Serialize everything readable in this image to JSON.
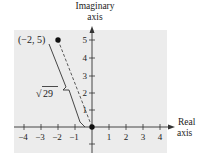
{
  "diagram": {
    "type": "complex-plane",
    "axes": {
      "x_label_line1": "Real",
      "x_label_line2": "axis",
      "y_label_line1": "Imaginary",
      "y_label_line2": "axis",
      "x_ticks": [
        "−4",
        "−3",
        "−2",
        "−1",
        "1",
        "2",
        "3",
        "4"
      ],
      "y_ticks": [
        "1",
        "2",
        "3",
        "4",
        "5"
      ]
    },
    "point": {
      "label": "(−2, 5)",
      "x": -2,
      "y": 5
    },
    "origin_point": {
      "x": 0,
      "y": 0
    },
    "distance_label": "29",
    "distance_label_prefix": "√",
    "colors": {
      "panel": "#ececec",
      "ink": "#222222"
    }
  }
}
